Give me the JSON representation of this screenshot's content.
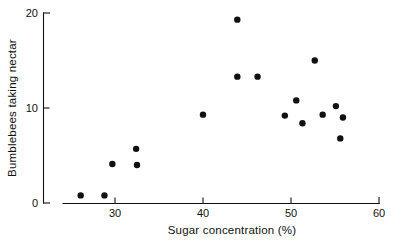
{
  "chart_data": {
    "type": "scatter",
    "title": "",
    "xlabel": "Sugar concentration (%)",
    "ylabel": "Bumblebees taking nectar",
    "xlim": [
      23.5,
      60.5
    ],
    "ylim": [
      0,
      20
    ],
    "xticks": [
      30,
      40,
      50,
      60
    ],
    "xtick_labels": [
      "30",
      "40",
      "50",
      "60"
    ],
    "yticks": [
      0,
      10,
      20
    ],
    "ytick_labels": [
      "0",
      "10",
      "20"
    ],
    "grid": false,
    "legend": null,
    "marker": "filled-circle",
    "marker_color": "#111111",
    "points": [
      {
        "x": 26.1,
        "y": 0.8
      },
      {
        "x": 28.8,
        "y": 0.8
      },
      {
        "x": 29.7,
        "y": 4.1
      },
      {
        "x": 32.4,
        "y": 5.7
      },
      {
        "x": 32.5,
        "y": 4.0
      },
      {
        "x": 40.0,
        "y": 9.3
      },
      {
        "x": 43.9,
        "y": 19.3
      },
      {
        "x": 43.9,
        "y": 13.3
      },
      {
        "x": 46.2,
        "y": 13.3
      },
      {
        "x": 49.3,
        "y": 9.2
      },
      {
        "x": 50.6,
        "y": 10.8
      },
      {
        "x": 51.3,
        "y": 8.4
      },
      {
        "x": 52.7,
        "y": 15.0
      },
      {
        "x": 53.6,
        "y": 9.3
      },
      {
        "x": 55.1,
        "y": 10.2
      },
      {
        "x": 55.6,
        "y": 6.8
      },
      {
        "x": 55.9,
        "y": 9.0
      }
    ]
  },
  "axis_labels": {
    "x_title": "Sugar concentration  (%)",
    "y_title": "Bumblebees taking nectar"
  }
}
